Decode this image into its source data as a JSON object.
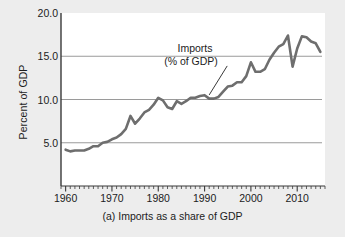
{
  "figure": {
    "caption": "(a) Imports as a share of GDP",
    "background_color": "#ededed",
    "plot_background_color": "#ffffff"
  },
  "chart_data": {
    "type": "line",
    "title": "",
    "subtitle": "",
    "caption": "(a) Imports as a share of GDP",
    "xlabel": "",
    "ylabel": "Percent of GDP",
    "xlim": [
      1959,
      2016
    ],
    "ylim": [
      0.0,
      20.0
    ],
    "grid": true,
    "grid_axis": "y",
    "legend": false,
    "legend_position": "none",
    "line_color": "#6e6e6e",
    "line_width": 2.6,
    "xticks": [
      1960,
      1970,
      1980,
      1990,
      2000,
      2010
    ],
    "xtick_labels": [
      "1960",
      "1970",
      "1980",
      "1990",
      "2000",
      "2010"
    ],
    "minor_xtick_interval": 1,
    "yticks": [
      5.0,
      10.0,
      15.0,
      20.0
    ],
    "ytick_labels": [
      "5.0",
      "10.0",
      "15.0",
      "20.0"
    ],
    "annotations": [
      {
        "text_line1": "Imports",
        "text_line2": "(% of GDP)",
        "points_to_x": 1991,
        "points_to_y": 10.3
      }
    ],
    "series": [
      {
        "name": "Imports (% of GDP)",
        "x": [
          1960,
          1961,
          1962,
          1963,
          1964,
          1965,
          1966,
          1967,
          1968,
          1969,
          1970,
          1971,
          1972,
          1973,
          1974,
          1975,
          1976,
          1977,
          1978,
          1979,
          1980,
          1981,
          1982,
          1983,
          1984,
          1985,
          1986,
          1987,
          1988,
          1989,
          1990,
          1991,
          1992,
          1993,
          1994,
          1995,
          1996,
          1997,
          1998,
          1999,
          2000,
          2001,
          2002,
          2003,
          2004,
          2005,
          2006,
          2007,
          2008,
          2009,
          2010,
          2011,
          2012,
          2013,
          2014,
          2015
        ],
        "values": [
          4.2,
          4.0,
          4.1,
          4.1,
          4.1,
          4.3,
          4.6,
          4.6,
          5.0,
          5.1,
          5.4,
          5.6,
          6.0,
          6.6,
          8.1,
          7.2,
          7.8,
          8.5,
          8.8,
          9.4,
          10.2,
          9.9,
          9.1,
          8.9,
          9.8,
          9.5,
          9.8,
          10.2,
          10.2,
          10.4,
          10.5,
          10.1,
          10.1,
          10.3,
          10.9,
          11.5,
          11.6,
          12.0,
          12.0,
          12.7,
          14.3,
          13.2,
          13.2,
          13.5,
          14.6,
          15.4,
          16.1,
          16.4,
          17.4,
          13.8,
          15.9,
          17.3,
          17.2,
          16.7,
          16.5,
          15.5
        ]
      }
    ]
  }
}
